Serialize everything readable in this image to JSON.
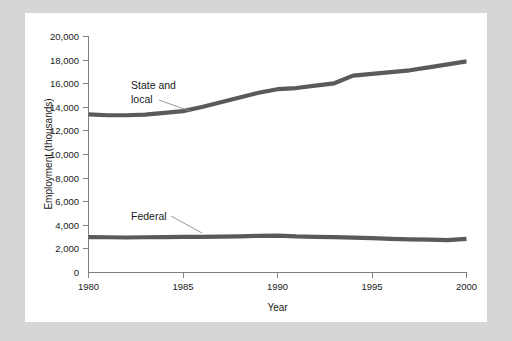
{
  "figure": {
    "background_color": "#d6d6d6",
    "card_color": "#ffffff",
    "line_color": "#5a5a5a",
    "axis_color": "#808080"
  },
  "chart_data": {
    "type": "line",
    "title": "",
    "xlabel": "Year",
    "ylabel": "Employment (thousands)",
    "xlim": [
      1980,
      2000
    ],
    "ylim": [
      0,
      20000
    ],
    "grid": false,
    "legend_position": "inline-annotations",
    "xticks": [
      1980,
      1985,
      1990,
      1995,
      2000
    ],
    "xtick_labels": [
      "1980",
      "1985",
      "1990",
      "1995",
      "2000"
    ],
    "yticks": [
      0,
      2000,
      4000,
      6000,
      8000,
      10000,
      12000,
      14000,
      16000,
      18000,
      20000
    ],
    "ytick_labels": [
      "0",
      "2,000",
      "4,000",
      "6,000",
      "8,000",
      "10,000",
      "12,000",
      "14,000",
      "16,000",
      "18,000",
      "20,000"
    ],
    "x": [
      1980,
      1981,
      1982,
      1983,
      1984,
      1985,
      1986,
      1987,
      1988,
      1989,
      1990,
      1991,
      1992,
      1993,
      1994,
      1995,
      1996,
      1997,
      1998,
      1999,
      2000
    ],
    "series": [
      {
        "name": "State and local",
        "label": "State and local",
        "label_line1": "State and",
        "label_line2": "local",
        "color": "#5a5a5a",
        "values": [
          13375,
          13300,
          13300,
          13350,
          13500,
          13650,
          14000,
          14400,
          14800,
          15200,
          15500,
          15600,
          15800,
          16000,
          16650,
          16800,
          16950,
          17100,
          17350,
          17600,
          17850
        ]
      },
      {
        "name": "Federal",
        "label": "Federal",
        "color": "#5a5a5a",
        "values": [
          2990,
          2980,
          2960,
          2980,
          3000,
          3020,
          3010,
          3030,
          3050,
          3100,
          3120,
          3050,
          3020,
          3000,
          2950,
          2900,
          2850,
          2800,
          2780,
          2740,
          2850
        ]
      }
    ],
    "annotations": [
      {
        "name": "state-and-local-annotation",
        "text_line1": "State and",
        "text_line2": "local"
      },
      {
        "name": "federal-annotation",
        "text": "Federal"
      }
    ]
  }
}
